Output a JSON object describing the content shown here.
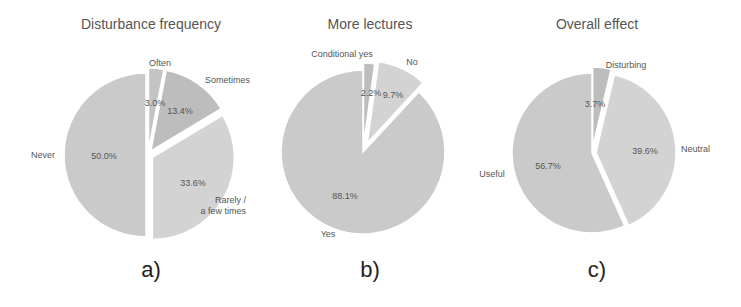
{
  "chart_data": [
    {
      "type": "pie",
      "title": "Disturbance frequency",
      "panel_label": "a)",
      "start_angle_deg": 90,
      "direction": "clockwise",
      "slices": [
        {
          "label": "Often",
          "value": 3.0,
          "pct_text": "3.0%",
          "color": "#c4c4c4",
          "explode": 5
        },
        {
          "label": "Sometimes",
          "value": 13.4,
          "pct_text": "13.4%",
          "color": "#bdbdbd",
          "explode": 5
        },
        {
          "label": "Rarely / a few times",
          "value": 33.6,
          "pct_text": "33.6%",
          "color": "#d3d3d3",
          "explode": 5
        },
        {
          "label": "Never",
          "value": 50.0,
          "pct_text": "50.0%",
          "color": "#cacaca",
          "explode": 2
        }
      ]
    },
    {
      "type": "pie",
      "title": "More lectures",
      "panel_label": "b)",
      "start_angle_deg": 90,
      "direction": "clockwise",
      "slices": [
        {
          "label": "Conditional yes",
          "value": 2.2,
          "pct_text": "2.2%",
          "color": "#bdbdbd",
          "explode": 7
        },
        {
          "label": "No",
          "value": 9.7,
          "pct_text": "9.7%",
          "color": "#d3d3d3",
          "explode": 10
        },
        {
          "label": "Yes",
          "value": 88.1,
          "pct_text": "88.1%",
          "color": "#cacaca",
          "explode": 0
        }
      ]
    },
    {
      "type": "pie",
      "title": "Overall effect",
      "panel_label": "c)",
      "start_angle_deg": 90,
      "direction": "clockwise",
      "slices": [
        {
          "label": "Disturbing",
          "value": 3.7,
          "pct_text": "3.7%",
          "color": "#bdbdbd",
          "explode": 6
        },
        {
          "label": "Neutral",
          "value": 39.6,
          "pct_text": "39.6%",
          "color": "#d3d3d3",
          "explode": 4
        },
        {
          "label": "Useful",
          "value": 56.7,
          "pct_text": "56.7%",
          "color": "#cacaca",
          "explode": 0
        }
      ]
    }
  ],
  "panels": [
    {
      "title": "Disturbance frequency",
      "label": "a)"
    },
    {
      "title": "More lectures",
      "label": "b)"
    },
    {
      "title": "Overall effect",
      "label": "c)"
    }
  ]
}
